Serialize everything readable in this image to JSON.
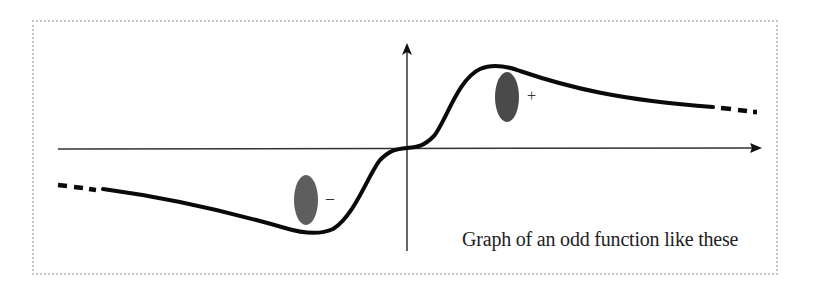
{
  "figure": {
    "caption": "Graph of an odd function like these",
    "signs": {
      "positive": "+",
      "negative": "–"
    },
    "colors": {
      "curve": "#0a0a0a",
      "axes": "#333333",
      "positive_region": "#4a4a4a",
      "negative_region": "#5e5e5e",
      "frame_border": "#c4c4c4"
    },
    "elements": {
      "x_axis": "horizontal axis with arrow pointing right",
      "y_axis": "vertical axis with arrow pointing up",
      "curve": "odd function curve: negative dip on the left, passes through origin, positive hump on the right, dashed continuation at both ends",
      "positive_marker": "dark ellipse above the curve peak on the right",
      "negative_marker": "dark ellipse above the curve trough on the left"
    }
  }
}
